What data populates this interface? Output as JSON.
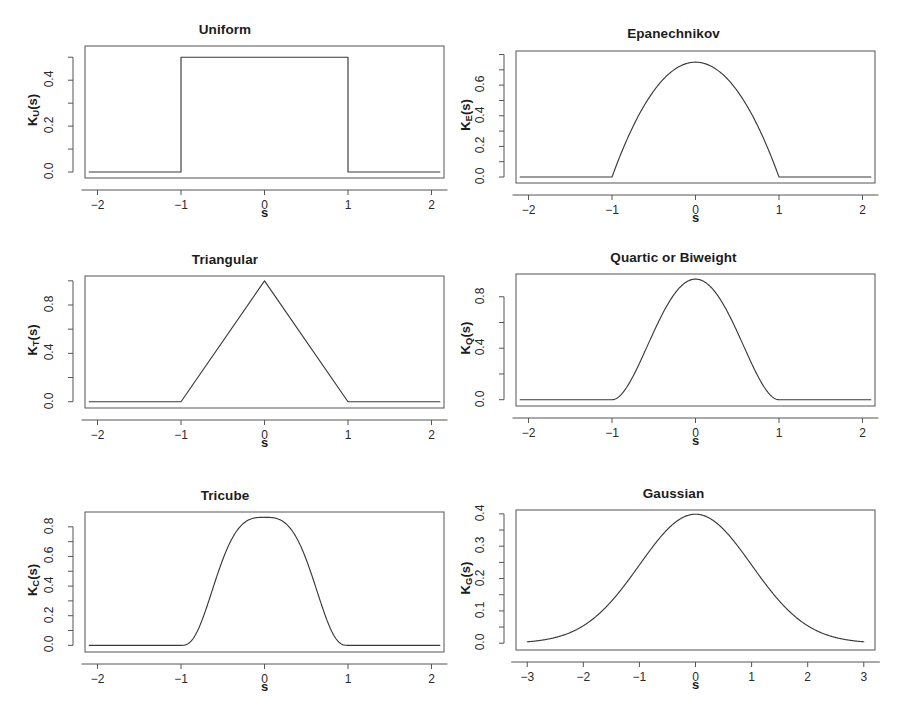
{
  "figure": {
    "layout": "2 columns x 3 rows of kernel function plots",
    "line_color": "#3a3a3a",
    "axis_color": "#555555",
    "background": "#ffffff"
  },
  "chart_data": [
    {
      "type": "line",
      "title": "Uniform",
      "xlabel": "s",
      "ylabel": "K_U(s)",
      "ylabel_base": "K",
      "ylabel_sub": "U",
      "ylabel_tail": "(s)",
      "xlim": [
        -2.15,
        2.15
      ],
      "ylim": [
        -0.026,
        0.549
      ],
      "xticks": [
        -2,
        -1,
        0,
        1,
        2
      ],
      "xticklabels": [
        "-2",
        "-1",
        "0",
        "1",
        "2"
      ],
      "yticks": [
        0.0,
        0.2,
        0.4
      ],
      "yticklabels": [
        "0.0",
        "0.2",
        "0.4"
      ],
      "yticks_minor": [
        0.1,
        0.3,
        0.5
      ],
      "grid": false,
      "legend": "none",
      "peak": 0.5,
      "support": [
        -1,
        1
      ],
      "formula": "0.5 for |s|<=1, else 0",
      "x": [
        -2.0,
        -1.0,
        -1.0,
        1.0,
        1.0,
        2.0
      ],
      "values": [
        0.0,
        0.0,
        0.5,
        0.5,
        0.0,
        0.0
      ]
    },
    {
      "type": "line",
      "title": "Epanechnikov",
      "xlabel": "s",
      "ylabel": "K_E(s)",
      "ylabel_base": "K",
      "ylabel_sub": "E",
      "ylabel_tail": "(s)",
      "xlim": [
        -2.15,
        2.15
      ],
      "ylim": [
        -0.039,
        0.823
      ],
      "xticks": [
        -2,
        -1,
        0,
        1,
        2
      ],
      "xticklabels": [
        "-2",
        "-1",
        "0",
        "1",
        "2"
      ],
      "yticks": [
        0.0,
        0.2,
        0.4,
        0.6
      ],
      "yticklabels": [
        "0.0",
        "0.2",
        "0.4",
        "0.6"
      ],
      "yticks_minor": [
        0.1,
        0.3,
        0.5,
        0.7,
        0.8
      ],
      "grid": false,
      "legend": "none",
      "peak": 0.75,
      "support": [
        -1,
        1
      ],
      "formula": "0.75*(1-s^2) for |s|<=1, else 0"
    },
    {
      "type": "line",
      "title": "Triangular",
      "xlabel": "s",
      "ylabel": "K_T(s)",
      "ylabel_base": "K",
      "ylabel_sub": "T",
      "ylabel_tail": "(s)",
      "xlim": [
        -2.15,
        2.15
      ],
      "ylim": [
        -0.052,
        1.04
      ],
      "xticks": [
        -2,
        -1,
        0,
        1,
        2
      ],
      "xticklabels": [
        "-2",
        "-1",
        "0",
        "1",
        "2"
      ],
      "yticks": [
        0.0,
        0.4,
        0.8
      ],
      "yticklabels": [
        "0.0",
        "0.4",
        "0.8"
      ],
      "yticks_minor": [
        0.2,
        0.6,
        1.0
      ],
      "grid": false,
      "legend": "none",
      "peak": 1.0,
      "support": [
        -1,
        1
      ],
      "formula": "1-|s| for |s|<=1, else 0",
      "x": [
        -2.0,
        -1.0,
        0.0,
        1.0,
        2.0
      ],
      "values": [
        0.0,
        0.0,
        1.0,
        0.0,
        0.0
      ]
    },
    {
      "type": "line",
      "title": "Quartic or Biweight",
      "xlabel": "s",
      "ylabel": "K_Q(s)",
      "ylabel_base": "K",
      "ylabel_sub": "Q",
      "ylabel_tail": "(s)",
      "xlim": [
        -2.15,
        2.15
      ],
      "ylim": [
        -0.049,
        0.977
      ],
      "xticks": [
        -2,
        -1,
        0,
        1,
        2
      ],
      "xticklabels": [
        "-2",
        "-1",
        "0",
        "1",
        "2"
      ],
      "yticks": [
        0.0,
        0.4,
        0.8
      ],
      "yticklabels": [
        "0.0",
        "0.4",
        "0.8"
      ],
      "yticks_minor": [
        0.2,
        0.6
      ],
      "grid": false,
      "legend": "none",
      "peak": 0.9375,
      "support": [
        -1,
        1
      ],
      "formula": "(15/16)*(1-s^2)^2 for |s|<=1, else 0"
    },
    {
      "type": "line",
      "title": "Tricube",
      "xlabel": "s",
      "ylabel": "K_C(s)",
      "ylabel_base": "K",
      "ylabel_sub": "C",
      "ylabel_tail": "(s)",
      "xlim": [
        -2.15,
        2.15
      ],
      "ylim": [
        -0.045,
        0.9
      ],
      "xticks": [
        -2,
        -1,
        0,
        1,
        2
      ],
      "xticklabels": [
        "-2",
        "-1",
        "0",
        "1",
        "2"
      ],
      "yticks": [
        0.0,
        0.2,
        0.4,
        0.6,
        0.8
      ],
      "yticklabels": [
        "0.0",
        "0.2",
        "0.4",
        "0.6",
        "0.8"
      ],
      "yticks_minor": [
        0.1,
        0.3,
        0.5,
        0.7
      ],
      "grid": false,
      "legend": "none",
      "peak": 0.8642,
      "support": [
        -1,
        1
      ],
      "formula": "(70/81)*(1-|s|^3)^3 for |s|<=1, else 0"
    },
    {
      "type": "line",
      "title": "Gaussian",
      "xlabel": "s",
      "ylabel": "K_G(s)",
      "ylabel_base": "K",
      "ylabel_sub": "G",
      "ylabel_tail": "(s)",
      "xlim": [
        -3.2,
        3.2
      ],
      "ylim": [
        -0.021,
        0.412
      ],
      "xticks": [
        -3,
        -2,
        -1,
        0,
        1,
        2,
        3
      ],
      "xticklabels": [
        "-3",
        "-2",
        "-1",
        "0",
        "1",
        "2",
        "3"
      ],
      "yticks": [
        0.0,
        0.1,
        0.2,
        0.3,
        0.4
      ],
      "yticklabels": [
        "0.0",
        "0.1",
        "0.2",
        "0.3",
        "0.4"
      ],
      "yticks_minor": [
        0.05,
        0.15,
        0.25,
        0.35
      ],
      "grid": false,
      "legend": "none",
      "peak": 0.3989,
      "support": [
        -3,
        3
      ],
      "formula": "(1/sqrt(2*pi))*exp(-s^2/2)"
    }
  ]
}
